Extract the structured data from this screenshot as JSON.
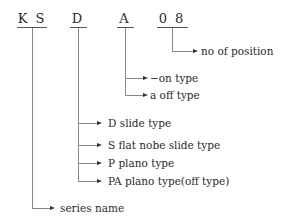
{
  "codes": [
    {
      "text": "K S",
      "meaning": "series name"
    },
    {
      "text": "D",
      "meaning": "type"
    },
    {
      "text": "A",
      "meaning": "contact type"
    },
    {
      "text": "0 8",
      "meaning": "no of position"
    }
  ],
  "labels": {
    "no_of_position": "no of position",
    "on_type": "−on type",
    "a_off_type": "a off type",
    "d_slide_type": "D slide type",
    "s_flat_nobe": "S flat nobe slide type",
    "p_plano": "P plano type",
    "pa_plano": "PA plano type(off type)",
    "series_name": "series name"
  }
}
